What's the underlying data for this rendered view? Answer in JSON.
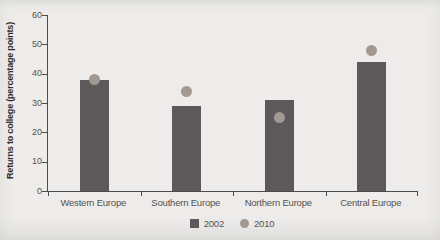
{
  "figure": {
    "background_color": "#edecea",
    "axis_color": "#4b4b4b",
    "text_color": "#55524f"
  },
  "chart_data": {
    "type": "bar",
    "title": "",
    "xlabel": "",
    "ylabel": "Returns to college (percentage points)",
    "categories": [
      "Western Europe",
      "Southern Europe",
      "Northern Europe",
      "Central Europe"
    ],
    "series": [
      {
        "name": "2002",
        "type": "bar",
        "marker": "square",
        "color": "#5d595b",
        "values": [
          38,
          29,
          31,
          44
        ]
      },
      {
        "name": "2010",
        "type": "scatter",
        "marker": "circle",
        "color": "#a29a92",
        "values": [
          38,
          34,
          25,
          48
        ]
      }
    ],
    "ylim": [
      0,
      60
    ],
    "yticks": [
      0,
      10,
      20,
      30,
      40,
      50,
      60
    ],
    "grid": false,
    "legend_position": "bottom-center",
    "legend": [
      "2002",
      "2010"
    ]
  }
}
